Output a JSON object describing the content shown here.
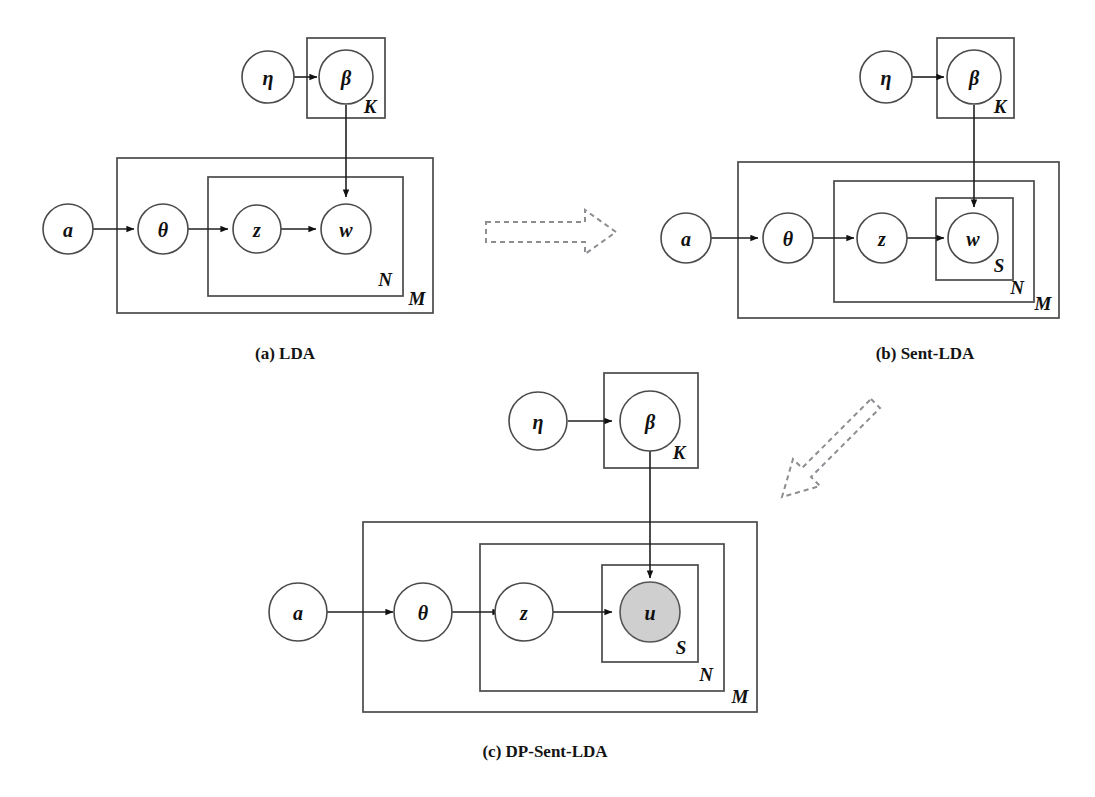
{
  "figure": {
    "background_color": "#ffffff",
    "node_stroke_color": "#4a4a4a",
    "observed_node_fill": "#cfcfcf",
    "latent_node_fill": "#ffffff",
    "edge_color": "#202020",
    "transition_arrow_color": "#8d8d92"
  },
  "panels": [
    {
      "id": "a",
      "caption": "(a) LDA",
      "nodes": [
        {
          "name": "eta",
          "label": "η",
          "observed": false
        },
        {
          "name": "beta",
          "label": "β",
          "observed": false
        },
        {
          "name": "alpha",
          "label": "a",
          "observed": false
        },
        {
          "name": "theta",
          "label": "θ",
          "observed": false
        },
        {
          "name": "z",
          "label": "z",
          "observed": false
        },
        {
          "name": "w",
          "label": "w",
          "observed": false
        }
      ],
      "plates": [
        {
          "name": "K",
          "label": "K"
        },
        {
          "name": "M",
          "label": "M"
        },
        {
          "name": "N",
          "label": "N"
        }
      ],
      "edges": [
        {
          "from": "eta",
          "to": "beta"
        },
        {
          "from": "beta",
          "to": "w"
        },
        {
          "from": "alpha",
          "to": "theta"
        },
        {
          "from": "theta",
          "to": "z"
        },
        {
          "from": "z",
          "to": "w"
        }
      ]
    },
    {
      "id": "b",
      "caption": "(b) Sent-LDA",
      "nodes": [
        {
          "name": "eta",
          "label": "η",
          "observed": false
        },
        {
          "name": "beta",
          "label": "β",
          "observed": false
        },
        {
          "name": "alpha",
          "label": "a",
          "observed": false
        },
        {
          "name": "theta",
          "label": "θ",
          "observed": false
        },
        {
          "name": "z",
          "label": "z",
          "observed": false
        },
        {
          "name": "w",
          "label": "w",
          "observed": false
        }
      ],
      "plates": [
        {
          "name": "K",
          "label": "K"
        },
        {
          "name": "M",
          "label": "M"
        },
        {
          "name": "N",
          "label": "N"
        },
        {
          "name": "S",
          "label": "S"
        }
      ],
      "edges": [
        {
          "from": "eta",
          "to": "beta"
        },
        {
          "from": "beta",
          "to": "w"
        },
        {
          "from": "alpha",
          "to": "theta"
        },
        {
          "from": "theta",
          "to": "z"
        },
        {
          "from": "z",
          "to": "w"
        }
      ]
    },
    {
      "id": "c",
      "caption": "(c) DP-Sent-LDA",
      "nodes": [
        {
          "name": "eta",
          "label": "η",
          "observed": false
        },
        {
          "name": "beta",
          "label": "β",
          "observed": false
        },
        {
          "name": "alpha",
          "label": "a",
          "observed": false
        },
        {
          "name": "theta",
          "label": "θ",
          "observed": false
        },
        {
          "name": "z",
          "label": "z",
          "observed": false
        },
        {
          "name": "u",
          "label": "u",
          "observed": true
        }
      ],
      "plates": [
        {
          "name": "K",
          "label": "K"
        },
        {
          "name": "M",
          "label": "M"
        },
        {
          "name": "N",
          "label": "N"
        },
        {
          "name": "S",
          "label": "S"
        }
      ],
      "edges": [
        {
          "from": "eta",
          "to": "beta"
        },
        {
          "from": "beta",
          "to": "u"
        },
        {
          "from": "alpha",
          "to": "theta"
        },
        {
          "from": "theta",
          "to": "z"
        },
        {
          "from": "z",
          "to": "u"
        }
      ]
    }
  ],
  "transitions": [
    {
      "name": "a-to-b",
      "direction": "right",
      "style": "dashed-outline-arrow"
    },
    {
      "name": "b-to-c",
      "direction": "down-left",
      "style": "dashed-outline-arrow"
    }
  ]
}
